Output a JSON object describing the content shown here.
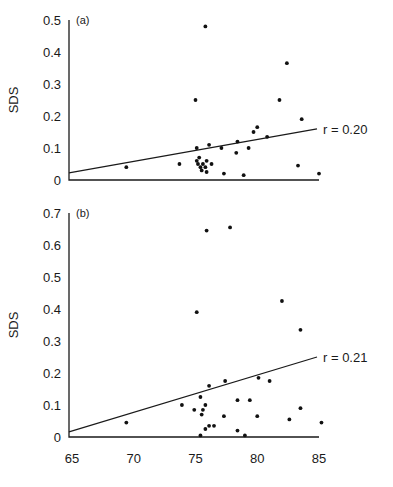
{
  "chart_data": [
    {
      "type": "scatter",
      "panel_label": "(a)",
      "title": "",
      "xlabel": "",
      "ylabel": "SDS",
      "xlim": [
        65,
        85
      ],
      "ylim": [
        0,
        0.5
      ],
      "yticks": [
        "0",
        "0.1",
        "0.2",
        "0.3",
        "0.4",
        "0.5"
      ],
      "ytick_values": [
        0,
        0.1,
        0.2,
        0.3,
        0.4,
        0.5
      ],
      "xticks": [],
      "grid": false,
      "fit_line": {
        "label": "r = 0.20",
        "x": [
          65,
          85
        ],
        "y": [
          0.022,
          0.16
        ]
      },
      "points": [
        [
          69.4,
          0.04
        ],
        [
          73.7,
          0.05
        ],
        [
          75.0,
          0.25
        ],
        [
          75.1,
          0.1
        ],
        [
          75.1,
          0.06
        ],
        [
          75.2,
          0.05
        ],
        [
          75.4,
          0.04
        ],
        [
          75.6,
          0.05
        ],
        [
          75.5,
          0.03
        ],
        [
          75.8,
          0.04
        ],
        [
          75.9,
          0.06
        ],
        [
          75.3,
          0.07
        ],
        [
          75.8,
          0.48
        ],
        [
          76.1,
          0.11
        ],
        [
          76.3,
          0.05
        ],
        [
          75.9,
          0.025
        ],
        [
          77.1,
          0.1
        ],
        [
          77.3,
          0.02
        ],
        [
          78.3,
          0.085
        ],
        [
          78.4,
          0.12
        ],
        [
          78.9,
          0.015
        ],
        [
          79.3,
          0.1
        ],
        [
          79.7,
          0.15
        ],
        [
          80.0,
          0.165
        ],
        [
          80.8,
          0.135
        ],
        [
          81.8,
          0.25
        ],
        [
          82.4,
          0.365
        ],
        [
          83.3,
          0.045
        ],
        [
          83.6,
          0.19
        ],
        [
          85.0,
          0.02
        ]
      ]
    },
    {
      "type": "scatter",
      "panel_label": "(b)",
      "title": "",
      "xlabel": "",
      "ylabel": "SDS",
      "xlim": [
        65,
        85
      ],
      "ylim": [
        0,
        0.7
      ],
      "yticks": [
        "0",
        "0.1",
        "0.2",
        "0.3",
        "0.4",
        "0.5",
        "0.6",
        "0.7"
      ],
      "ytick_values": [
        0,
        0.1,
        0.2,
        0.3,
        0.4,
        0.5,
        0.6,
        0.7
      ],
      "xticks": [
        "65",
        "70",
        "75",
        "80",
        "85"
      ],
      "xtick_values": [
        65,
        70,
        75,
        80,
        85
      ],
      "grid": false,
      "fit_line": {
        "label": "r = 0.21",
        "x": [
          65,
          85
        ],
        "y": [
          0.016,
          0.25
        ]
      },
      "points": [
        [
          69.4,
          0.045
        ],
        [
          73.9,
          0.1
        ],
        [
          74.9,
          0.085
        ],
        [
          75.1,
          0.39
        ],
        [
          75.4,
          0.125
        ],
        [
          75.6,
          0.085
        ],
        [
          75.8,
          0.1
        ],
        [
          75.5,
          0.07
        ],
        [
          75.4,
          0.005
        ],
        [
          75.8,
          0.025
        ],
        [
          76.1,
          0.035
        ],
        [
          76.5,
          0.035
        ],
        [
          75.9,
          0.645
        ],
        [
          76.1,
          0.16
        ],
        [
          77.3,
          0.065
        ],
        [
          77.4,
          0.175
        ],
        [
          77.8,
          0.655
        ],
        [
          78.4,
          0.115
        ],
        [
          78.4,
          0.02
        ],
        [
          79.0,
          0.005
        ],
        [
          79.4,
          0.115
        ],
        [
          80.0,
          0.065
        ],
        [
          80.1,
          0.185
        ],
        [
          81.0,
          0.175
        ],
        [
          82.0,
          0.425
        ],
        [
          82.6,
          0.055
        ],
        [
          83.5,
          0.335
        ],
        [
          83.5,
          0.09
        ],
        [
          85.2,
          0.045
        ]
      ]
    }
  ]
}
